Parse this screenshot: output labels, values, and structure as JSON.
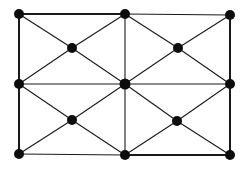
{
  "diagram": {
    "type": "graph",
    "colors": {
      "edge": "#1a1a1a",
      "node": "#0d0d0d",
      "background": "#ffffff"
    },
    "nodes": [
      {
        "id": "TL",
        "x": 19,
        "y": 14
      },
      {
        "id": "TM",
        "x": 125,
        "y": 14
      },
      {
        "id": "TR",
        "x": 230,
        "y": 15
      },
      {
        "id": "ML",
        "x": 19,
        "y": 84
      },
      {
        "id": "C",
        "x": 125,
        "y": 84
      },
      {
        "id": "MR",
        "x": 230,
        "y": 84
      },
      {
        "id": "BL",
        "x": 19,
        "y": 154
      },
      {
        "id": "BM",
        "x": 125,
        "y": 155
      },
      {
        "id": "BR",
        "x": 230,
        "y": 155
      },
      {
        "id": "Q1",
        "x": 72,
        "y": 48
      },
      {
        "id": "Q2",
        "x": 178,
        "y": 48
      },
      {
        "id": "Q3",
        "x": 72,
        "y": 120
      },
      {
        "id": "Q4",
        "x": 177,
        "y": 121
      }
    ],
    "edges": [
      [
        "TL",
        "TM"
      ],
      [
        "TM",
        "TR"
      ],
      [
        "ML",
        "C"
      ],
      [
        "C",
        "MR"
      ],
      [
        "BL",
        "BM"
      ],
      [
        "BM",
        "BR"
      ],
      [
        "TL",
        "ML"
      ],
      [
        "ML",
        "BL"
      ],
      [
        "TM",
        "C"
      ],
      [
        "C",
        "BM"
      ],
      [
        "TR",
        "MR"
      ],
      [
        "MR",
        "BR"
      ],
      [
        "TL",
        "Q1"
      ],
      [
        "Q1",
        "C"
      ],
      [
        "TM",
        "Q1"
      ],
      [
        "Q1",
        "ML"
      ],
      [
        "TM",
        "Q2"
      ],
      [
        "Q2",
        "MR"
      ],
      [
        "TR",
        "Q2"
      ],
      [
        "Q2",
        "C"
      ],
      [
        "ML",
        "Q3"
      ],
      [
        "Q3",
        "BM"
      ],
      [
        "C",
        "Q3"
      ],
      [
        "Q3",
        "BL"
      ],
      [
        "C",
        "Q4"
      ],
      [
        "Q4",
        "BR"
      ],
      [
        "MR",
        "Q4"
      ],
      [
        "Q4",
        "BM"
      ]
    ]
  }
}
